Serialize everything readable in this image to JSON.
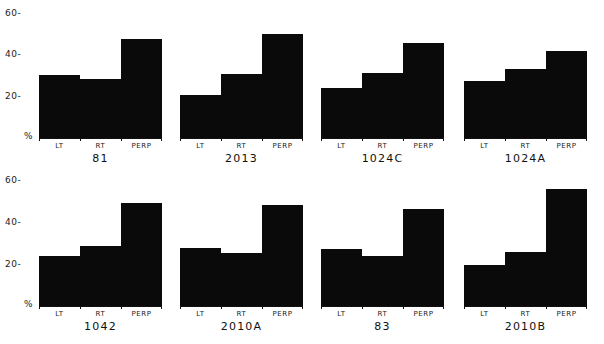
{
  "figure": {
    "y_axis_ticks": [
      "60-",
      "40-",
      "20-",
      "%"
    ],
    "categories": [
      "LT",
      "RT",
      "PERP"
    ]
  },
  "chart_data": [
    {
      "type": "bar",
      "title": "81",
      "categories": [
        "LT",
        "RT",
        "PERP"
      ],
      "values": [
        30,
        28,
        47
      ],
      "ylabel": "%",
      "ylim": [
        0,
        60
      ],
      "yticks": [
        20,
        40,
        60
      ]
    },
    {
      "type": "bar",
      "title": "2013",
      "categories": [
        "LT",
        "RT",
        "PERP"
      ],
      "values": [
        20.5,
        30.5,
        49.5
      ],
      "ylabel": "%",
      "ylim": [
        0,
        60
      ],
      "yticks": [
        20,
        40,
        60
      ]
    },
    {
      "type": "bar",
      "title": "1024C",
      "categories": [
        "LT",
        "RT",
        "PERP"
      ],
      "values": [
        24,
        31,
        45
      ],
      "ylabel": "%",
      "ylim": [
        0,
        60
      ],
      "yticks": [
        20,
        40,
        60
      ]
    },
    {
      "type": "bar",
      "title": "1024A",
      "categories": [
        "LT",
        "RT",
        "PERP"
      ],
      "values": [
        27,
        33,
        41.5
      ],
      "ylabel": "%",
      "ylim": [
        0,
        60
      ],
      "yticks": [
        20,
        40,
        60
      ]
    },
    {
      "type": "bar",
      "title": "1042",
      "categories": [
        "LT",
        "RT",
        "PERP"
      ],
      "values": [
        24,
        28.5,
        49
      ],
      "ylabel": "%",
      "ylim": [
        0,
        60
      ],
      "yticks": [
        20,
        40,
        60
      ]
    },
    {
      "type": "bar",
      "title": "2010A",
      "categories": [
        "LT",
        "RT",
        "PERP"
      ],
      "values": [
        27.5,
        25,
        48
      ],
      "ylabel": "%",
      "ylim": [
        0,
        60
      ],
      "yticks": [
        20,
        40,
        60
      ]
    },
    {
      "type": "bar",
      "title": "83",
      "categories": [
        "LT",
        "RT",
        "PERP"
      ],
      "values": [
        27,
        24,
        46
      ],
      "ylabel": "%",
      "ylim": [
        0,
        60
      ],
      "yticks": [
        20,
        40,
        60
      ]
    },
    {
      "type": "bar",
      "title": "2010B",
      "categories": [
        "LT",
        "RT",
        "PERP"
      ],
      "values": [
        19.5,
        25.5,
        55.5
      ],
      "ylabel": "%",
      "ylim": [
        0,
        60
      ],
      "yticks": [
        20,
        40,
        60
      ]
    }
  ],
  "colors": {
    "bar": "#0a0a0a",
    "background": "#ffffff",
    "text": "#1a1a1a"
  }
}
